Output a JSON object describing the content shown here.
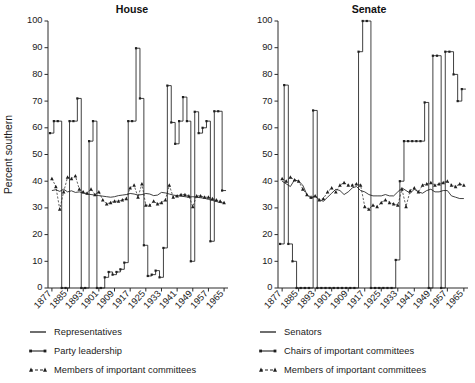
{
  "figure": {
    "ylabel": "Percent southern",
    "panels": [
      "House",
      "Senate"
    ]
  },
  "legends": {
    "house": {
      "name": "house-legend",
      "items": [
        {
          "key": "solid-line",
          "label": "Representatives"
        },
        {
          "key": "dot-line",
          "label": "Party leadership"
        },
        {
          "key": "dashed-triangle-line",
          "label": "Members of important committees"
        }
      ]
    },
    "senate": {
      "name": "senate-legend",
      "items": [
        {
          "key": "solid-line",
          "label": "Senators"
        },
        {
          "key": "dot-line",
          "label": "Chairs of important committees"
        },
        {
          "key": "dashed-triangle-line",
          "label": "Members of important committees"
        }
      ]
    }
  },
  "chart_data": [
    {
      "type": "line",
      "title": "House",
      "xlabel": "",
      "ylabel": "Percent southern",
      "xlim": [
        1875,
        1967
      ],
      "ylim": [
        0,
        100
      ],
      "yticks": [
        0,
        10,
        20,
        30,
        40,
        50,
        60,
        70,
        80,
        90,
        100
      ],
      "xticks": [
        1877,
        1885,
        1893,
        1901,
        1909,
        1917,
        1925,
        1933,
        1941,
        1949,
        1957,
        1965
      ],
      "grid": false,
      "legend_position": "below",
      "series": [
        {
          "name": "Representatives",
          "style": "step-solid",
          "x": [
            1877,
            1879,
            1881,
            1883,
            1885,
            1887,
            1889,
            1891,
            1893,
            1895,
            1897,
            1899,
            1901,
            1903,
            1905,
            1907,
            1909,
            1911,
            1913,
            1915,
            1917,
            1919,
            1921,
            1923,
            1925,
            1927,
            1929,
            1931,
            1933,
            1935,
            1937,
            1939,
            1941,
            1943,
            1945,
            1947,
            1949,
            1951,
            1953,
            1955,
            1957,
            1959,
            1961,
            1963,
            1965
          ],
          "values": [
            36.5,
            36.8,
            36.2,
            37.0,
            36.0,
            36.4,
            35.8,
            36.0,
            35.6,
            35.2,
            35.0,
            34.8,
            34.6,
            34.4,
            34.2,
            34.0,
            34.2,
            34.6,
            34.8,
            35.0,
            35.4,
            35.2,
            34.8,
            35.0,
            35.4,
            35.2,
            34.6,
            34.8,
            35.8,
            35.6,
            35.2,
            34.8,
            34.6,
            34.4,
            34.2,
            34.0,
            34.2,
            34.0,
            33.8,
            33.6,
            33.2,
            32.8,
            32.4,
            32.0,
            31.8
          ]
        },
        {
          "name": "Party leadership",
          "style": "step-dot",
          "x": [
            1877,
            1879,
            1881,
            1883,
            1885,
            1887,
            1889,
            1891,
            1893,
            1895,
            1897,
            1899,
            1901,
            1903,
            1905,
            1907,
            1909,
            1911,
            1913,
            1915,
            1917,
            1919,
            1921,
            1923,
            1925,
            1927,
            1929,
            1931,
            1933,
            1935,
            1937,
            1939,
            1941,
            1943,
            1945,
            1947,
            1949,
            1951,
            1953,
            1955,
            1957,
            1959,
            1961,
            1963,
            1965
          ],
          "values": [
            58.0,
            62.5,
            62.5,
            0.0,
            0.0,
            62.5,
            62.5,
            71.0,
            0.0,
            0.0,
            55.0,
            62.5,
            0.0,
            0.0,
            4.0,
            6.0,
            5.0,
            6.0,
            7.0,
            9.5,
            62.5,
            62.5,
            89.8,
            71.0,
            16.0,
            4.5,
            5.0,
            6.5,
            4.0,
            15.0,
            75.8,
            62.0,
            54.0,
            62.5,
            71.5,
            62.5,
            10.0,
            66.0,
            58.0,
            60.0,
            62.5,
            17.5,
            66.2,
            66.2,
            36.5
          ]
        },
        {
          "name": "Members of important committees",
          "style": "dashed-tri",
          "x": [
            1877,
            1879,
            1881,
            1883,
            1885,
            1887,
            1889,
            1891,
            1893,
            1895,
            1897,
            1899,
            1901,
            1903,
            1905,
            1907,
            1909,
            1911,
            1913,
            1915,
            1917,
            1919,
            1921,
            1923,
            1925,
            1927,
            1929,
            1931,
            1933,
            1935,
            1937,
            1939,
            1941,
            1943,
            1945,
            1947,
            1949,
            1951,
            1953,
            1955,
            1957,
            1959,
            1961,
            1963,
            1965
          ],
          "values": [
            41.0,
            38.0,
            29.5,
            36.0,
            41.5,
            41.0,
            42.0,
            37.0,
            36.0,
            35.5,
            37.0,
            35.0,
            36.0,
            33.0,
            31.5,
            32.0,
            32.5,
            32.5,
            33.0,
            33.5,
            37.5,
            38.5,
            34.0,
            39.0,
            31.0,
            31.0,
            32.5,
            31.5,
            32.0,
            33.0,
            38.5,
            34.0,
            34.5,
            35.0,
            35.0,
            34.5,
            30.5,
            34.5,
            34.5,
            34.0,
            34.0,
            33.5,
            33.0,
            32.5,
            32.0
          ]
        }
      ]
    },
    {
      "type": "line",
      "title": "Senate",
      "xlabel": "",
      "ylabel": "Percent southern",
      "xlim": [
        1875,
        1967
      ],
      "ylim": [
        0,
        100
      ],
      "yticks": [
        0,
        10,
        20,
        30,
        40,
        50,
        60,
        70,
        80,
        90,
        100
      ],
      "xticks": [
        1877,
        1885,
        1893,
        1901,
        1909,
        1917,
        1925,
        1933,
        1941,
        1949,
        1957,
        1965
      ],
      "grid": false,
      "legend_position": "below",
      "series": [
        {
          "name": "Senators",
          "style": "step-solid",
          "x": [
            1877,
            1879,
            1881,
            1883,
            1885,
            1887,
            1889,
            1891,
            1893,
            1895,
            1897,
            1899,
            1901,
            1903,
            1905,
            1907,
            1909,
            1911,
            1913,
            1915,
            1917,
            1919,
            1921,
            1923,
            1925,
            1927,
            1929,
            1931,
            1933,
            1935,
            1937,
            1939,
            1941,
            1943,
            1945,
            1947,
            1949,
            1951,
            1953,
            1955,
            1957,
            1959,
            1961,
            1963,
            1965
          ],
          "values": [
            40.0,
            39.0,
            38.0,
            40.5,
            40.0,
            38.5,
            35.0,
            33.5,
            34.5,
            33.0,
            32.5,
            34.0,
            35.5,
            37.0,
            36.5,
            35.0,
            36.0,
            37.5,
            38.0,
            36.5,
            36.0,
            35.0,
            34.5,
            34.5,
            34.5,
            35.0,
            34.5,
            34.5,
            36.0,
            37.5,
            36.5,
            35.5,
            37.0,
            36.0,
            35.5,
            36.5,
            37.0,
            36.0,
            36.0,
            36.5,
            36.5,
            34.5,
            34.0,
            33.5,
            33.5
          ]
        },
        {
          "name": "Chairs of important committees",
          "style": "step-dot",
          "x": [
            1877,
            1879,
            1881,
            1883,
            1885,
            1887,
            1889,
            1891,
            1893,
            1895,
            1897,
            1899,
            1901,
            1903,
            1905,
            1907,
            1909,
            1911,
            1913,
            1915,
            1917,
            1919,
            1921,
            1923,
            1925,
            1927,
            1929,
            1931,
            1933,
            1935,
            1937,
            1939,
            1941,
            1943,
            1945,
            1947,
            1949,
            1951,
            1953,
            1955,
            1957,
            1959,
            1961,
            1963,
            1965
          ],
          "values": [
            16.5,
            76.0,
            16.5,
            10.0,
            0.0,
            0.0,
            0.0,
            0.0,
            66.5,
            0.0,
            0.0,
            0.0,
            0.0,
            0.0,
            0.0,
            0.0,
            0.0,
            0.0,
            0.0,
            88.5,
            100.0,
            100.0,
            0.0,
            0.0,
            0.0,
            0.0,
            0.0,
            0.0,
            10.5,
            40.0,
            55.0,
            55.0,
            55.0,
            55.0,
            55.0,
            69.5,
            0.0,
            87.0,
            87.0,
            0.0,
            88.5,
            88.5,
            80.0,
            70.0,
            74.5
          ]
        },
        {
          "name": "Members of important committees",
          "style": "dashed-tri",
          "x": [
            1877,
            1879,
            1881,
            1883,
            1885,
            1887,
            1889,
            1891,
            1893,
            1895,
            1897,
            1899,
            1901,
            1903,
            1905,
            1907,
            1909,
            1911,
            1913,
            1915,
            1917,
            1919,
            1921,
            1923,
            1925,
            1927,
            1929,
            1931,
            1933,
            1935,
            1937,
            1939,
            1941,
            1943,
            1945,
            1947,
            1949,
            1951,
            1953,
            1955,
            1957,
            1959,
            1961,
            1963,
            1965
          ],
          "values": [
            41.0,
            40.0,
            41.5,
            40.5,
            40.0,
            37.0,
            35.0,
            34.0,
            34.5,
            33.0,
            33.5,
            36.0,
            37.5,
            36.0,
            38.5,
            39.5,
            38.5,
            38.5,
            39.0,
            38.5,
            30.5,
            29.5,
            31.0,
            30.5,
            32.0,
            33.0,
            32.0,
            31.5,
            31.0,
            37.0,
            30.5,
            36.5,
            37.5,
            36.0,
            38.5,
            39.0,
            39.5,
            38.5,
            39.0,
            39.5,
            40.0,
            38.5,
            38.0,
            39.0,
            38.5
          ]
        }
      ]
    }
  ]
}
